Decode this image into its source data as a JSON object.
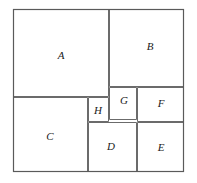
{
  "figure": {
    "canvas": {
      "width": 197,
      "height": 183
    },
    "frame": {
      "x": 13,
      "y": 9,
      "width": 171,
      "height": 163
    },
    "stroke_color": "#6b6b6b",
    "frame_color": "#5a5a5a",
    "fill_color": "#ffffff",
    "label_color": "#1a1a1a",
    "regions": [
      {
        "id": "A",
        "label": "A",
        "x": 13,
        "y": 9,
        "width": 96,
        "height": 88,
        "label_x": 61,
        "label_y": 56
      },
      {
        "id": "B",
        "label": "B",
        "x": 109,
        "y": 9,
        "width": 75,
        "height": 78,
        "label_x": 150,
        "label_y": 47
      },
      {
        "id": "C",
        "label": "C",
        "x": 13,
        "y": 97,
        "width": 75,
        "height": 75,
        "label_x": 50,
        "label_y": 137
      },
      {
        "id": "H",
        "label": "H",
        "x": 88,
        "y": 97,
        "width": 21,
        "height": 25,
        "label_x": 98,
        "label_y": 111
      },
      {
        "id": "G",
        "label": "G",
        "x": 109,
        "y": 87,
        "width": 28,
        "height": 33,
        "label_x": 124,
        "label_y": 101
      },
      {
        "id": "F",
        "label": "F",
        "x": 137,
        "y": 87,
        "width": 47,
        "height": 35,
        "label_x": 161,
        "label_y": 104
      },
      {
        "id": "D",
        "label": "D",
        "x": 88,
        "y": 122,
        "width": 49,
        "height": 50,
        "label_x": 111,
        "label_y": 147
      },
      {
        "id": "E",
        "label": "E",
        "x": 137,
        "y": 122,
        "width": 47,
        "height": 50,
        "label_x": 161,
        "label_y": 148
      }
    ]
  }
}
